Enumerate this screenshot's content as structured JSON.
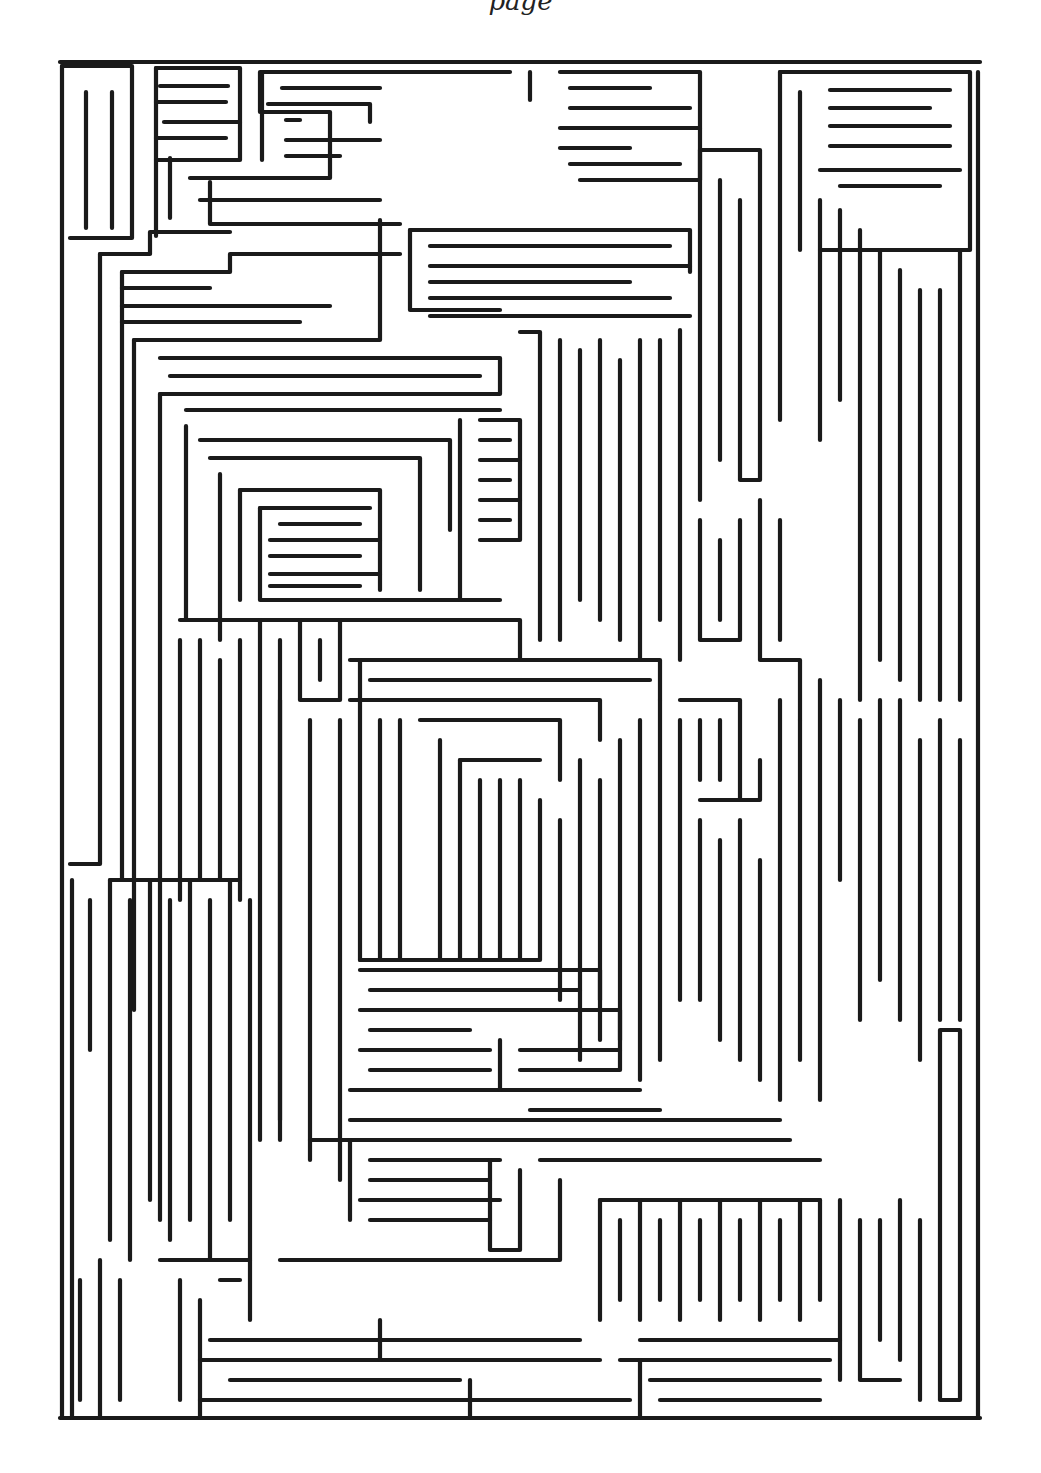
{
  "page": {
    "header_fragment": "page",
    "ink_color": "#1a1a1a",
    "paper_color": "#ffffff"
  },
  "maze": {
    "bounds": {
      "left": 60,
      "top": 62,
      "right": 980,
      "bottom": 1418
    },
    "walls": [
      "M62 66 L62 1418",
      "M62 66 L132 66 L132 238 L70 238",
      "M86 92 L86 228",
      "M112 92 L112 228",
      "M156 68 L240 68 L240 160 L156 160",
      "M160 86 L228 86",
      "M156 102 L226 102",
      "M164 122 L240 122",
      "M156 138 L226 138",
      "M156 68 L156 236",
      "M170 158 L170 218",
      "M190 178 L330 178 L330 112 L260 112 L260 72 L510 72",
      "M262 72 L262 160",
      "M282 88 L380 88",
      "M268 104 L370 104 L370 122",
      "M286 120 L300 120",
      "M286 140 L380 140",
      "M286 156 L340 156",
      "M210 182 L210 224 L400 224",
      "M200 200 L380 200",
      "M100 254 L100 864 L70 864",
      "M100 254 L150 254 L150 232 L230 232",
      "M122 272 L230 272 L230 254 L400 254",
      "M122 288 L210 288",
      "M122 306 L330 306",
      "M122 322 L300 322",
      "M122 272 L122 880",
      "M134 340 L380 340 L380 220",
      "M134 340 L134 1010",
      "M160 358 L500 358 L500 394 L160 394",
      "M170 376 L480 376",
      "M160 394 L160 1220",
      "M186 410 L500 410",
      "M186 426 L186 620",
      "M200 440 L450 440 L450 530",
      "M210 458 L420 458 L420 590",
      "M220 474 L220 640",
      "M240 490 L380 490 L380 590",
      "M240 490 L240 600",
      "M260 508 L370 508",
      "M260 508 L260 600 L500 600",
      "M280 524 L360 524",
      "M270 540 L380 540",
      "M270 556 L360 556",
      "M270 574 L380 574",
      "M270 586 L360 586",
      "M410 230 L690 230 L690 272",
      "M410 230 L410 310 L500 310",
      "M430 246 L670 246",
      "M430 266 L690 266",
      "M430 282 L630 282",
      "M430 298 L670 298",
      "M430 316 L690 316",
      "M520 332 L540 332 L540 640",
      "M560 340 L560 640",
      "M580 350 L580 600",
      "M600 340 L600 620",
      "M620 360 L620 640",
      "M640 340 L640 660",
      "M660 340 L660 620",
      "M680 330 L680 660",
      "M480 420 L520 420 L520 540 L480 540",
      "M480 440 L510 440",
      "M480 460 L520 460",
      "M480 480 L510 480",
      "M480 500 L520 500",
      "M480 520 L510 520",
      "M460 420 L460 600",
      "M530 72 L530 100",
      "M560 72 L700 72 L700 180 L580 180",
      "M570 88 L650 88",
      "M570 108 L690 108",
      "M560 128 L700 128",
      "M560 148 L630 148",
      "M570 164 L680 164",
      "M700 150 L700 500",
      "M720 180 L720 460",
      "M740 200 L740 480 L760 480 L760 150 L700 150",
      "M780 72 L780 420",
      "M780 72 L970 72 L970 250 L820 250",
      "M800 92 L800 250",
      "M830 90 L950 90",
      "M830 108 L930 108",
      "M830 126 L950 126",
      "M830 146 L950 146",
      "M820 170 L960 170",
      "M840 186 L940 186",
      "M820 200 L820 440",
      "M840 210 L840 400",
      "M860 230 L860 700",
      "M880 250 L880 660",
      "M900 270 L900 680",
      "M920 290 L920 700",
      "M940 290 L940 700",
      "M960 250 L960 700",
      "M978 72 L978 1418",
      "M760 500 L760 660 L800 660 L800 720",
      "M780 520 L780 640",
      "M700 520 L700 640 L740 640 L740 520",
      "M720 540 L720 620",
      "M180 620 L520 620 L520 660",
      "M200 640 L200 880",
      "M180 640 L180 900",
      "M220 660 L220 880",
      "M240 640 L240 900",
      "M260 620 L260 1140",
      "M280 640 L280 1120",
      "M300 620 L300 700 L340 700 L340 620",
      "M320 640 L320 680",
      "M280 700 L280 1140",
      "M350 660 L660 660 L660 700",
      "M370 680 L650 680",
      "M350 700 L600 700 L600 740",
      "M360 660 L360 960",
      "M310 720 L310 1160",
      "M340 720 L340 1180",
      "M380 720 L380 960",
      "M400 720 L400 960",
      "M420 720 L560 720 L560 780",
      "M440 740 L440 960",
      "M460 760 L540 760",
      "M460 760 L460 960",
      "M480 780 L480 960",
      "M500 780 L500 960",
      "M520 780 L520 960",
      "M540 800 L540 960 L360 960",
      "M560 820 L560 1000",
      "M580 760 L580 1060",
      "M600 780 L600 1040",
      "M620 740 L620 1040",
      "M640 720 L640 1080",
      "M660 700 L660 1060",
      "M680 700 L740 700 L740 800",
      "M700 720 L700 780",
      "M720 720 L720 780",
      "M680 720 L680 1000",
      "M700 800 L760 800 L760 760",
      "M700 820 L700 1000",
      "M720 840 L720 1040",
      "M740 820 L740 1060",
      "M760 860 L760 1080",
      "M780 700 L780 1100",
      "M800 720 L800 1060",
      "M820 680 L820 1100",
      "M840 700 L840 880",
      "M860 720 L860 1020",
      "M880 700 L880 980",
      "M900 700 L900 1020",
      "M920 740 L920 1060",
      "M940 720 L940 1020",
      "M960 740 L960 1020",
      "M940 1030 L960 1030 L960 1400 L940 1400 L940 1030",
      "M72 880 L72 1418",
      "M90 900 L90 1050",
      "M110 880 L240 880",
      "M110 880 L110 1240",
      "M130 900 L130 1260",
      "M150 880 L150 1200",
      "M170 900 L170 1240",
      "M190 880 L190 1220",
      "M210 900 L210 1260",
      "M230 880 L230 1220",
      "M250 900 L250 1260",
      "M360 970 L600 970 L600 1000",
      "M370 990 L580 990",
      "M360 1010 L620 1010 L620 1070 L520 1070",
      "M370 1030 L470 1030",
      "M360 1050 L490 1050",
      "M370 1070 L490 1070",
      "M350 1090 L640 1090",
      "M500 1040 L500 1090",
      "M520 1050 L620 1050",
      "M530 1110 L660 1110",
      "M350 1120 L780 1120",
      "M310 1140 L790 1140",
      "M350 1140 L350 1220",
      "M370 1160 L500 1160",
      "M370 1180 L490 1180",
      "M360 1200 L500 1200",
      "M370 1220 L490 1220",
      "M490 1160 L490 1250 L520 1250 L520 1170",
      "M540 1160 L820 1160",
      "M560 1180 L560 1260 L280 1260",
      "M600 1200 L820 1200",
      "M600 1200 L600 1320",
      "M620 1220 L620 1300",
      "M640 1200 L640 1320",
      "M660 1220 L660 1300",
      "M680 1200 L680 1320",
      "M700 1220 L700 1300",
      "M720 1200 L720 1320",
      "M740 1220 L740 1300",
      "M760 1200 L760 1320",
      "M780 1220 L780 1300",
      "M800 1200 L800 1320",
      "M820 1200 L820 1300",
      "M840 1200 L840 1380",
      "M860 1220 L860 1380 L900 1380",
      "M880 1220 L880 1340",
      "M900 1200 L900 1360",
      "M920 1220 L920 1400",
      "M80 1280 L80 1400",
      "M100 1260 L100 1418",
      "M120 1280 L120 1400",
      "M160 1260 L250 1260 L250 1320",
      "M180 1280 L180 1400",
      "M200 1300 L200 1418",
      "M220 1280 L240 1280",
      "M210 1340 L580 1340",
      "M200 1360 L600 1360",
      "M230 1380 L460 1380",
      "M380 1320 L380 1360",
      "M200 1400 L630 1400",
      "M470 1380 L470 1418",
      "M640 1340 L840 1340",
      "M620 1360 L830 1360",
      "M650 1380 L820 1380",
      "M640 1360 L640 1418",
      "M660 1400 L820 1400",
      "M200 1418 L830 1418"
    ]
  }
}
